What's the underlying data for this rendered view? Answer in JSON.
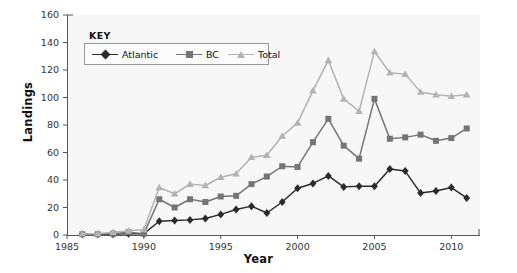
{
  "chart_data": {
    "type": "line",
    "title": "",
    "xlabel": "Year",
    "ylabel": "Landings",
    "xlim": [
      1985,
      2011.8
    ],
    "ylim": [
      0,
      160
    ],
    "xticks": [
      1985,
      1990,
      1995,
      2000,
      2005,
      2010
    ],
    "xtick_labels": [
      "1985",
      "1990",
      "1995",
      "2000",
      "2005",
      "2010"
    ],
    "yticks": [
      0,
      20,
      40,
      60,
      80,
      100,
      120,
      140,
      160
    ],
    "ytick_labels": [
      "0",
      "20",
      "40",
      "60",
      "80",
      "100",
      "120",
      "140",
      "160"
    ],
    "grid": false,
    "legend_position": "upper-left",
    "legend_title": "KEY",
    "x": [
      1986,
      1987,
      1988,
      1989,
      1990,
      1991,
      1992,
      1993,
      1994,
      1995,
      1996,
      1997,
      1998,
      1999,
      2000,
      2001,
      2002,
      2003,
      2004,
      2005,
      2006,
      2007,
      2008,
      2009,
      2010,
      2011
    ],
    "series": [
      {
        "name": "Atlantic",
        "color": "#2b2b2b",
        "marker": "diamond",
        "values": [
          0.5,
          0.5,
          0.5,
          1,
          1,
          10,
          10.5,
          11,
          12,
          15,
          18.5,
          21,
          16,
          24,
          34,
          37.5,
          43,
          35,
          35.5,
          35.5,
          48,
          46.5,
          30.5,
          32,
          34.5,
          27
        ]
      },
      {
        "name": "BC",
        "color": "#757575",
        "marker": "square",
        "values": [
          0.5,
          0.5,
          1,
          2,
          1,
          26,
          20,
          26,
          24,
          28,
          28.5,
          37,
          42.5,
          50,
          49.5,
          67.5,
          84.5,
          65,
          55.5,
          99,
          70,
          71,
          73,
          68.5,
          70.5,
          77.5
        ]
      },
      {
        "name": "Total",
        "color": "#b3b3b3",
        "marker": "triangle",
        "values": [
          1,
          1,
          2,
          3,
          4,
          34.5,
          30,
          37,
          36,
          42,
          44.5,
          56.5,
          58,
          72,
          81.5,
          105,
          127,
          99,
          90,
          133.5,
          118,
          117,
          104,
          102,
          101,
          102
        ]
      }
    ]
  },
  "axis": {
    "y_label": "Landings",
    "x_label": "Year"
  },
  "legend": {
    "title": "KEY",
    "entries": [
      "Atlantic",
      "BC",
      "Total"
    ]
  },
  "colors": {
    "atlantic": "#2b2b2b",
    "bc": "#757575",
    "total": "#b3b3b3",
    "axis": "#555555",
    "plot_bg": "#f7f7f7"
  }
}
